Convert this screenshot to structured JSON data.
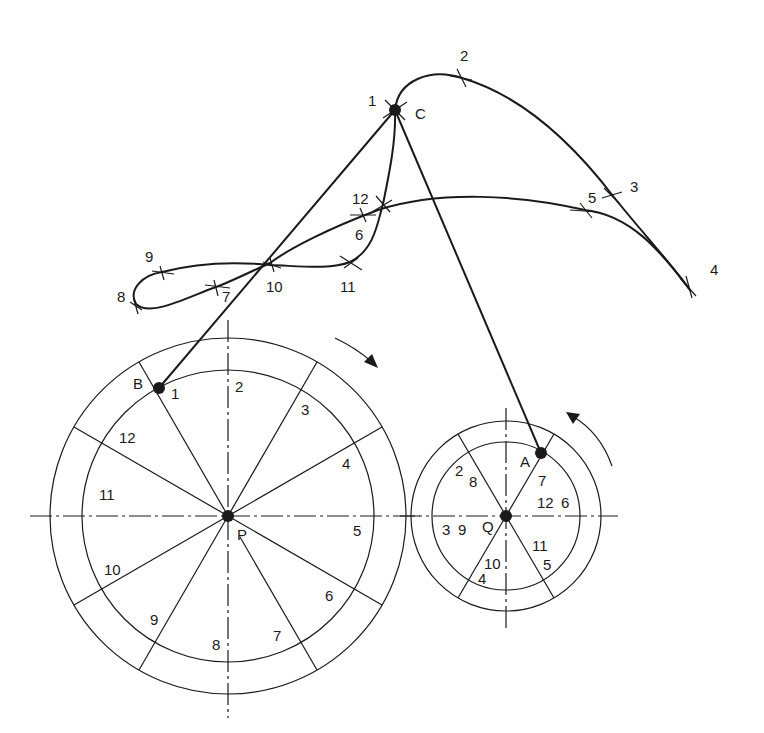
{
  "points": {
    "C": "C",
    "B": "B",
    "A": "A",
    "P": "P",
    "Q": "Q"
  },
  "large_gear": {
    "center_label": "P",
    "division_labels": [
      "1",
      "2",
      "3",
      "4",
      "5",
      "6",
      "7",
      "8",
      "9",
      "10",
      "11",
      "12"
    ]
  },
  "small_gear": {
    "center_label": "Q",
    "division_labels": [
      "7",
      "12",
      "6",
      "11",
      "5",
      "10",
      "4",
      "3",
      "9",
      "2",
      "8"
    ]
  },
  "locus": {
    "labels": [
      "1",
      "2",
      "3",
      "4",
      "5",
      "6",
      "7",
      "8",
      "9",
      "10",
      "11",
      "12"
    ]
  },
  "colors": {
    "ink": "#1a1a1a",
    "background": "#ffffff"
  }
}
